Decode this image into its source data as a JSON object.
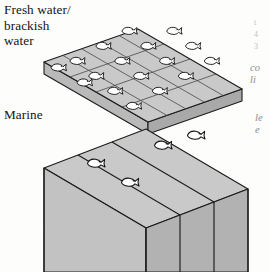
{
  "figure": {
    "title_label": "Fresh water/\nbrackish\nwater",
    "marine_label": "Marine",
    "right_margin_fragments": {
      "top": "t\n4\n3",
      "middle": "co\nli",
      "lower": "le\ne"
    },
    "colors": {
      "background": "#fdfdfb",
      "top_face": "#c9c9c9",
      "left_face": "#c2c2c2",
      "right_face": "#b4b4b4",
      "outline": "#1d1d1d",
      "grid_line": "#4a4a4a",
      "fish_fill": "#ffffff",
      "fish_outline": "#111111",
      "text": "#141414"
    },
    "slab": {
      "name": "freshwater-brackish-slab",
      "description": "thin flat slab subdivided into a grid of small tiles, each containing one fish",
      "rows": 4,
      "cols": 5,
      "fish_count": 18,
      "thickness_px": 12
    },
    "blocks": {
      "name": "marine-blocks",
      "description": "three tall deep rectangular blocks, each with a fish on its top face",
      "count": 3,
      "fish_count": 4,
      "depth_px": 150
    }
  }
}
